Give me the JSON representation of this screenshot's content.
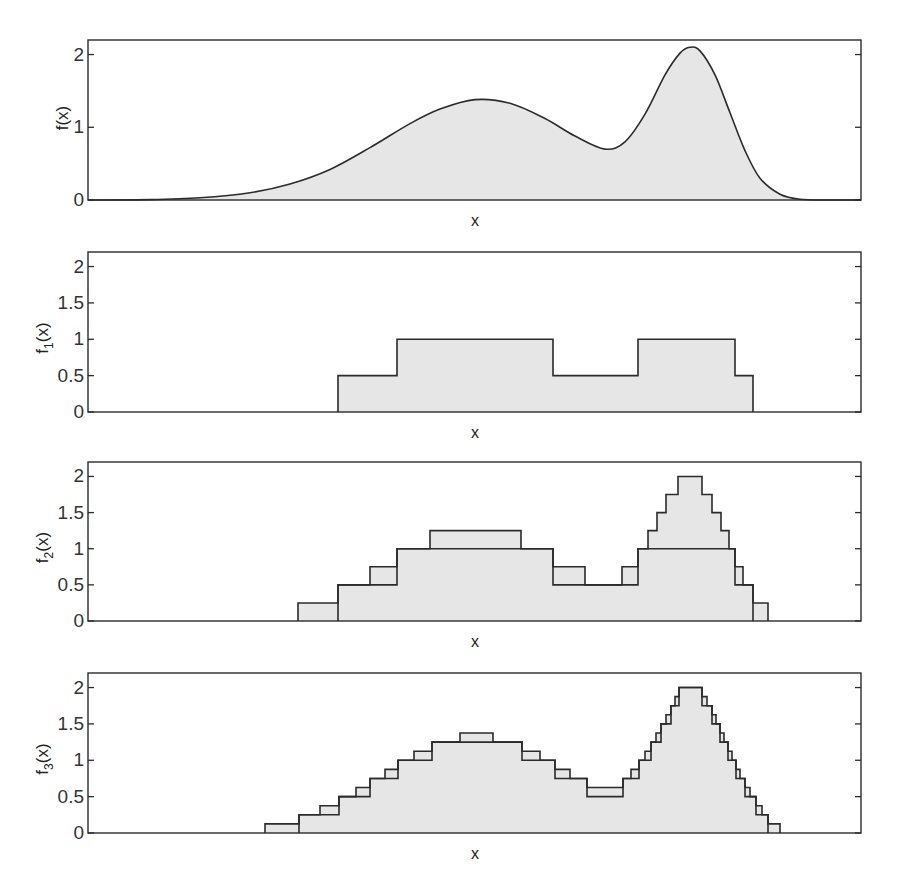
{
  "chart_data": [
    {
      "type": "area",
      "title": "",
      "xlabel": "x",
      "ylabel": "f(x)",
      "ylabel_sub": "",
      "ylim": [
        0,
        2.2
      ],
      "yticks": [
        0,
        1,
        2
      ],
      "ytick_labels": [
        "0",
        "1",
        "2"
      ],
      "grid": false,
      "description": "Smooth bimodal function with broad peak (~1.38) and sharp peak (~2.1)",
      "curve_px_x": [
        88,
        150,
        200,
        250,
        290,
        330,
        370,
        410,
        440,
        475,
        510,
        545,
        575,
        605,
        625,
        645,
        665,
        680,
        690,
        700,
        715,
        730,
        745,
        760,
        780,
        800,
        830,
        861
      ],
      "curve_values": [
        0.0,
        0.005,
        0.03,
        0.1,
        0.22,
        0.42,
        0.72,
        1.05,
        1.25,
        1.38,
        1.33,
        1.12,
        0.88,
        0.7,
        0.8,
        1.18,
        1.72,
        2.02,
        2.1,
        2.05,
        1.72,
        1.2,
        0.68,
        0.3,
        0.08,
        0.01,
        0.0,
        0.0
      ]
    },
    {
      "type": "step",
      "title": "",
      "xlabel": "x",
      "ylabel": "f(x)",
      "ylabel_sub": "1",
      "ylim": [
        0,
        2.2
      ],
      "yticks": [
        0,
        0.5,
        1,
        1.5,
        2
      ],
      "ytick_labels": [
        "0",
        "0.5",
        "1",
        "1.5",
        "2"
      ],
      "grid": false,
      "description": "Level-1 step approximation (resolution 0.5)",
      "steps": [
        {
          "x0": 338,
          "x1": 397,
          "y": 0.5
        },
        {
          "x0": 397,
          "x1": 553,
          "y": 1.0
        },
        {
          "x0": 553,
          "x1": 638,
          "y": 0.5
        },
        {
          "x0": 638,
          "x1": 735,
          "y": 1.0
        },
        {
          "x0": 735,
          "x1": 753,
          "y": 0.5
        }
      ]
    },
    {
      "type": "step",
      "title": "",
      "xlabel": "x",
      "ylabel": "f(x)",
      "ylabel_sub": "2",
      "ylim": [
        0,
        2.2
      ],
      "yticks": [
        0,
        0.5,
        1,
        1.5,
        2
      ],
      "ytick_labels": [
        "0",
        "0.5",
        "1",
        "1.5",
        "2"
      ],
      "grid": false,
      "description": "Level-2 step approximation (resolution 0.25), overlaid with level-1 outline",
      "steps": [
        {
          "x0": 298,
          "x1": 338,
          "y": 0.25
        },
        {
          "x0": 338,
          "x1": 370,
          "y": 0.5
        },
        {
          "x0": 370,
          "x1": 397,
          "y": 0.75
        },
        {
          "x0": 397,
          "x1": 430,
          "y": 1.0
        },
        {
          "x0": 430,
          "x1": 521,
          "y": 1.25
        },
        {
          "x0": 521,
          "x1": 553,
          "y": 1.0
        },
        {
          "x0": 553,
          "x1": 585,
          "y": 0.75
        },
        {
          "x0": 585,
          "x1": 622,
          "y": 0.5
        },
        {
          "x0": 622,
          "x1": 638,
          "y": 0.75
        },
        {
          "x0": 638,
          "x1": 648,
          "y": 1.0
        },
        {
          "x0": 648,
          "x1": 657,
          "y": 1.25
        },
        {
          "x0": 657,
          "x1": 666,
          "y": 1.5
        },
        {
          "x0": 666,
          "x1": 678,
          "y": 1.75
        },
        {
          "x0": 678,
          "x1": 702,
          "y": 2.0
        },
        {
          "x0": 702,
          "x1": 712,
          "y": 1.75
        },
        {
          "x0": 712,
          "x1": 721,
          "y": 1.5
        },
        {
          "x0": 721,
          "x1": 729,
          "y": 1.25
        },
        {
          "x0": 729,
          "x1": 735,
          "y": 1.0
        },
        {
          "x0": 735,
          "x1": 743,
          "y": 0.75
        },
        {
          "x0": 743,
          "x1": 753,
          "y": 0.5
        },
        {
          "x0": 753,
          "x1": 768,
          "y": 0.25
        }
      ],
      "overlay_steps": [
        {
          "x0": 338,
          "x1": 397,
          "y": 0.5
        },
        {
          "x0": 397,
          "x1": 553,
          "y": 1.0
        },
        {
          "x0": 553,
          "x1": 638,
          "y": 0.5
        },
        {
          "x0": 638,
          "x1": 735,
          "y": 1.0
        },
        {
          "x0": 735,
          "x1": 753,
          "y": 0.5
        }
      ]
    },
    {
      "type": "step",
      "title": "",
      "xlabel": "x",
      "ylabel": "f(x)",
      "ylabel_sub": "3",
      "ylim": [
        0,
        2.2
      ],
      "yticks": [
        0,
        0.5,
        1,
        1.5,
        2
      ],
      "ytick_labels": [
        "0",
        "0.5",
        "1",
        "1.5",
        "2"
      ],
      "grid": false,
      "description": "Level-3 step approximation (resolution 0.125), overlaid with level-2 outline",
      "steps": [
        {
          "x0": 265,
          "x1": 299,
          "y": 0.125
        },
        {
          "x0": 299,
          "x1": 320,
          "y": 0.25
        },
        {
          "x0": 320,
          "x1": 339,
          "y": 0.375
        },
        {
          "x0": 339,
          "x1": 356,
          "y": 0.5
        },
        {
          "x0": 356,
          "x1": 370,
          "y": 0.625
        },
        {
          "x0": 370,
          "x1": 385,
          "y": 0.75
        },
        {
          "x0": 385,
          "x1": 398,
          "y": 0.875
        },
        {
          "x0": 398,
          "x1": 414,
          "y": 1.0
        },
        {
          "x0": 414,
          "x1": 432,
          "y": 1.125
        },
        {
          "x0": 432,
          "x1": 460,
          "y": 1.25
        },
        {
          "x0": 460,
          "x1": 493,
          "y": 1.375
        },
        {
          "x0": 493,
          "x1": 522,
          "y": 1.25
        },
        {
          "x0": 522,
          "x1": 540,
          "y": 1.125
        },
        {
          "x0": 540,
          "x1": 555,
          "y": 1.0
        },
        {
          "x0": 555,
          "x1": 570,
          "y": 0.875
        },
        {
          "x0": 570,
          "x1": 587,
          "y": 0.75
        },
        {
          "x0": 587,
          "x1": 623,
          "y": 0.625
        },
        {
          "x0": 623,
          "x1": 631,
          "y": 0.75
        },
        {
          "x0": 631,
          "x1": 639,
          "y": 0.875
        },
        {
          "x0": 639,
          "x1": 645,
          "y": 1.0
        },
        {
          "x0": 645,
          "x1": 651,
          "y": 1.125
        },
        {
          "x0": 651,
          "x1": 656,
          "y": 1.25
        },
        {
          "x0": 656,
          "x1": 661,
          "y": 1.375
        },
        {
          "x0": 661,
          "x1": 666,
          "y": 1.5
        },
        {
          "x0": 666,
          "x1": 671,
          "y": 1.625
        },
        {
          "x0": 671,
          "x1": 675,
          "y": 1.75
        },
        {
          "x0": 675,
          "x1": 679,
          "y": 1.875
        },
        {
          "x0": 679,
          "x1": 702,
          "y": 2.0
        },
        {
          "x0": 702,
          "x1": 707,
          "y": 1.875
        },
        {
          "x0": 707,
          "x1": 712,
          "y": 1.75
        },
        {
          "x0": 712,
          "x1": 716,
          "y": 1.625
        },
        {
          "x0": 716,
          "x1": 720,
          "y": 1.5
        },
        {
          "x0": 720,
          "x1": 724,
          "y": 1.375
        },
        {
          "x0": 724,
          "x1": 728,
          "y": 1.25
        },
        {
          "x0": 728,
          "x1": 732,
          "y": 1.125
        },
        {
          "x0": 732,
          "x1": 736,
          "y": 1.0
        },
        {
          "x0": 736,
          "x1": 740,
          "y": 0.875
        },
        {
          "x0": 740,
          "x1": 745,
          "y": 0.75
        },
        {
          "x0": 745,
          "x1": 750,
          "y": 0.625
        },
        {
          "x0": 750,
          "x1": 756,
          "y": 0.5
        },
        {
          "x0": 756,
          "x1": 762,
          "y": 0.375
        },
        {
          "x0": 762,
          "x1": 768,
          "y": 0.25
        },
        {
          "x0": 768,
          "x1": 780,
          "y": 0.125
        }
      ],
      "overlay_steps": [
        {
          "x0": 299,
          "x1": 339,
          "y": 0.25
        },
        {
          "x0": 339,
          "x1": 370,
          "y": 0.5
        },
        {
          "x0": 370,
          "x1": 398,
          "y": 0.75
        },
        {
          "x0": 398,
          "x1": 432,
          "y": 1.0
        },
        {
          "x0": 432,
          "x1": 522,
          "y": 1.25
        },
        {
          "x0": 522,
          "x1": 555,
          "y": 1.0
        },
        {
          "x0": 555,
          "x1": 587,
          "y": 0.75
        },
        {
          "x0": 587,
          "x1": 623,
          "y": 0.5
        },
        {
          "x0": 623,
          "x1": 639,
          "y": 0.75
        },
        {
          "x0": 639,
          "x1": 651,
          "y": 1.0
        },
        {
          "x0": 651,
          "x1": 661,
          "y": 1.25
        },
        {
          "x0": 661,
          "x1": 671,
          "y": 1.5
        },
        {
          "x0": 671,
          "x1": 679,
          "y": 1.75
        },
        {
          "x0": 679,
          "x1": 702,
          "y": 2.0
        },
        {
          "x0": 702,
          "x1": 712,
          "y": 1.75
        },
        {
          "x0": 712,
          "x1": 720,
          "y": 1.5
        },
        {
          "x0": 720,
          "x1": 728,
          "y": 1.25
        },
        {
          "x0": 728,
          "x1": 736,
          "y": 1.0
        },
        {
          "x0": 736,
          "x1": 745,
          "y": 0.75
        },
        {
          "x0": 745,
          "x1": 756,
          "y": 0.5
        },
        {
          "x0": 756,
          "x1": 768,
          "y": 0.25
        }
      ]
    }
  ],
  "layout": {
    "panels": [
      {
        "top": 40,
        "bottom": 200,
        "left": 88,
        "right": 861
      },
      {
        "top": 252,
        "bottom": 412,
        "left": 88,
        "right": 861
      },
      {
        "top": 462,
        "bottom": 621,
        "left": 88,
        "right": 861
      },
      {
        "top": 673,
        "bottom": 833,
        "left": 88,
        "right": 861
      }
    ],
    "colors": {
      "fill": "#e6e6e6",
      "line": "#2b2b2b"
    }
  }
}
